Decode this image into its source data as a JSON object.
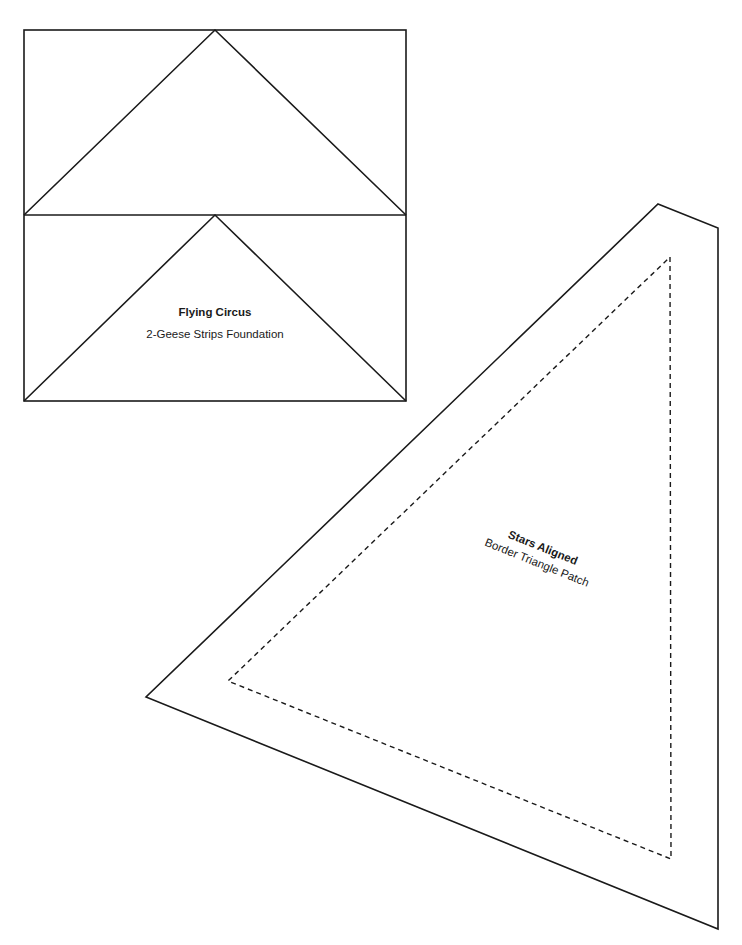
{
  "page": {
    "background": "#ffffff",
    "line_color": "#1a1a1a"
  },
  "flying_circus": {
    "title": "Flying Circus",
    "subtitle": "2-Geese Strips Foundation"
  },
  "stars_aligned": {
    "title": "Stars Aligned",
    "subtitle": "Border Triangle Patch"
  }
}
